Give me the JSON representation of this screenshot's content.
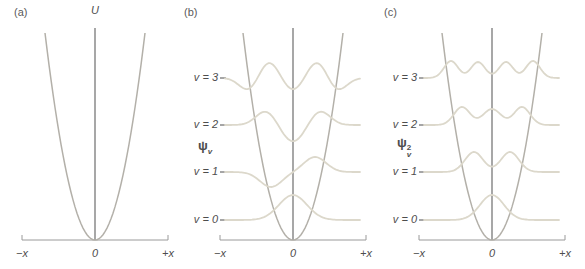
{
  "figure_title": "Harmonic oscillator: potential, wavefunctions and probability densities",
  "panels": {
    "a": {
      "label": "(a)",
      "y_axis_label": "U",
      "x_labels": {
        "left": "−x",
        "zero": "0",
        "right": "+x"
      }
    },
    "b": {
      "label": "(b)",
      "psi": {
        "base": "ψ",
        "sub": "v"
      },
      "levels": [
        {
          "label": "v = 3"
        },
        {
          "label": "v = 2"
        },
        {
          "label": "v = 1"
        },
        {
          "label": "v = 0"
        }
      ],
      "x_labels": {
        "left": "−x",
        "zero": "0",
        "right": "+x"
      }
    },
    "c": {
      "label": "(c)",
      "psi": {
        "base": "ψ",
        "sub": "v",
        "sup": "2"
      },
      "levels": [
        {
          "label": "v = 3"
        },
        {
          "label": "v = 2"
        },
        {
          "label": "v = 1"
        },
        {
          "label": "v = 0"
        }
      ],
      "x_labels": {
        "left": "−x",
        "zero": "0",
        "right": "+x"
      }
    }
  },
  "colors": {
    "background": "#ffffff",
    "potential_curve": "#b3b0a9",
    "wavefunction_curve": "#dcd8cb",
    "vertical_axis": "#8a8a8a",
    "x_axis": "#9a9a9a",
    "text": "#4d4d4d"
  },
  "chart_data": {
    "type": "line",
    "panels": [
      {
        "id": "a",
        "depicts": "Parabolic potential energy U versus displacement x"
      },
      {
        "id": "b",
        "depicts": "Wavefunctions ψv for v = 0,1,2,3 drawn on evenly spaced energy levels inside the parabolic potential"
      },
      {
        "id": "c",
        "depicts": "Probability densities ψv² for v = 0,1,2,3; each has v + 1 maxima"
      }
    ],
    "quantum_numbers_top_to_bottom": [
      3,
      2,
      1,
      0
    ],
    "x_axis_tick_labels": [
      "−x",
      "0",
      "+x"
    ],
    "render": {
      "panel_centers": {
        "a": 95,
        "b": 293,
        "c": 492
      },
      "x_axis_y": 240,
      "x_axis_halfspan": 73,
      "v_axis_top": 28,
      "tick_len": 5,
      "level_y": {
        "3": 78,
        "2": 125,
        "1": 172,
        "0": 220
      },
      "level_tick": {
        "x_from_center": -73,
        "len": 6
      },
      "parabola": {
        "halfwidth": 50,
        "top_y": 33
      },
      "curve_halfspan": 68,
      "psi_bumps": {
        "0": [
          [
            0,
            25,
            14
          ]
        ],
        "1": [
          [
            -22,
            -15,
            11
          ],
          [
            22,
            15,
            11
          ]
        ],
        "2": [
          [
            -27,
            14,
            10
          ],
          [
            0,
            -17,
            11
          ],
          [
            27,
            14,
            10
          ]
        ],
        "3": [
          [
            -45,
            -12,
            9
          ],
          [
            -24,
            16,
            9
          ],
          [
            0,
            -12,
            9
          ],
          [
            24,
            16,
            9
          ],
          [
            45,
            -12,
            9
          ]
        ]
      },
      "psi2_bumps": {
        "0": [
          [
            0,
            25,
            12
          ]
        ],
        "1": [
          [
            -18,
            20,
            9
          ],
          [
            18,
            20,
            9
          ]
        ],
        "2": [
          [
            -30,
            18,
            8
          ],
          [
            0,
            16,
            9
          ],
          [
            30,
            18,
            8
          ]
        ],
        "3": [
          [
            -41,
            17,
            7
          ],
          [
            -14,
            16,
            7
          ],
          [
            14,
            16,
            7
          ],
          [
            41,
            17,
            7
          ]
        ]
      }
    }
  }
}
